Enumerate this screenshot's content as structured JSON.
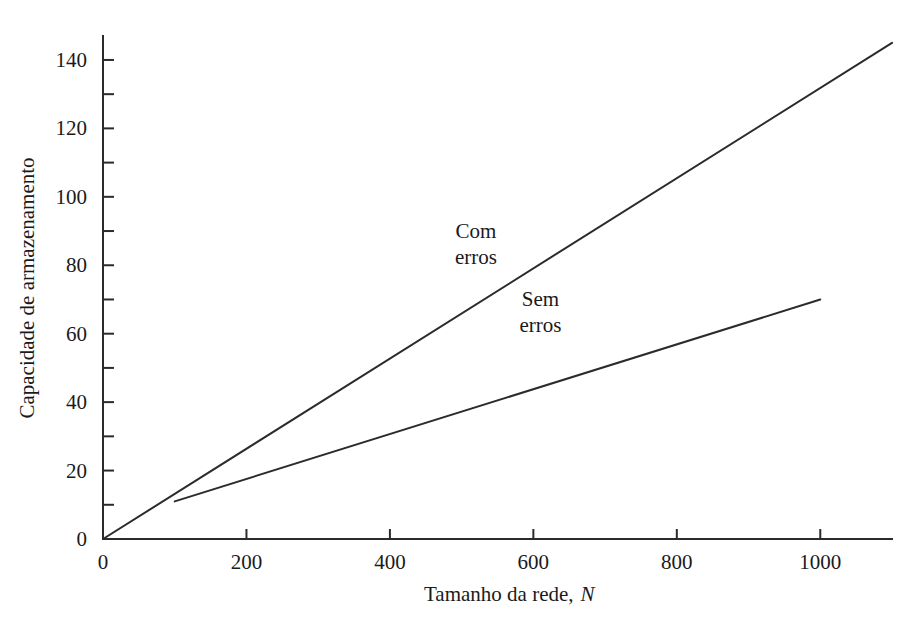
{
  "chart_data": {
    "type": "line",
    "title": "",
    "subtitle": "",
    "xlabel": "Tamanho da rede,",
    "xlabel_italic_symbol": "N",
    "ylabel": "Capacidade de armazenamento",
    "xlim": [
      0,
      1100
    ],
    "ylim": [
      0,
      147
    ],
    "grid": false,
    "legend_position": "inline-annotation",
    "x_major_ticks": [
      0,
      200,
      400,
      600,
      800,
      1000
    ],
    "x_tick_labels": [
      "0",
      "200",
      "400",
      "600",
      "800",
      "1000"
    ],
    "x_minor_ticks": [],
    "y_major_ticks": [
      0,
      20,
      40,
      60,
      80,
      100,
      120,
      140
    ],
    "y_tick_labels": [
      "0",
      "20",
      "40",
      "60",
      "80",
      "100",
      "120",
      "140"
    ],
    "y_minor_ticks": [
      10,
      30,
      50,
      70,
      90,
      110,
      130
    ],
    "series": [
      {
        "name": "Com erros",
        "label_line1": "Com",
        "label_line2": "erros",
        "annotation_x": 520,
        "annotation_y": 88,
        "x": [
          0,
          1100
        ],
        "values": [
          0,
          145
        ],
        "slope_per_unit": 0.1318,
        "endpoint_x": 1100,
        "endpoint_y": 145
      },
      {
        "name": "Sem erros",
        "label_line1": "Sem",
        "label_line2": "erros",
        "annotation_x": 610,
        "annotation_y": 68,
        "x": [
          100,
          1000
        ],
        "values": [
          11,
          70
        ],
        "slope_per_unit": 0.0656,
        "endpoint_x": 1000,
        "endpoint_y": 70
      }
    ]
  },
  "colors": {
    "background": "#ffffff",
    "ink": "#2b2b2b",
    "text": "#1a1a1a"
  }
}
